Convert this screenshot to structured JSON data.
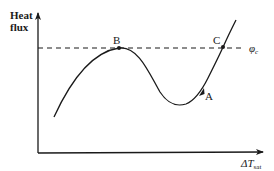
{
  "diagram": {
    "type": "boiling-curve",
    "y_axis_label_line1": "Heat",
    "y_axis_label_line2": "flux",
    "x_axis_label_main": "ΔT",
    "x_axis_label_sub": "sat",
    "critical_flux_label_main": "φ",
    "critical_flux_label_sub": "c",
    "points": {
      "A": "A",
      "B": "B",
      "C": "C"
    },
    "colors": {
      "line": "#1a1a1a",
      "background": "#ffffff"
    }
  }
}
